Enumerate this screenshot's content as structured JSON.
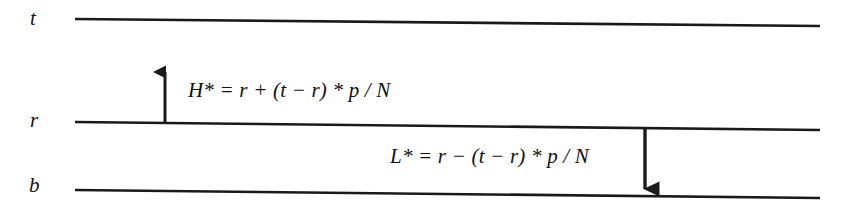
{
  "figure": {
    "type": "annotated-line-diagram",
    "background_color": "#ffffff",
    "line_color": "#1a1a1a",
    "text_color": "#111111",
    "levels": [
      {
        "id": "top",
        "label": "t",
        "label_x": 30,
        "label_y": 8,
        "line_x1": 75,
        "line_y1": 19,
        "line_x2": 820,
        "line_y2": 26
      },
      {
        "id": "middle",
        "label": "r",
        "label_x": 30,
        "label_y": 110,
        "line_x1": 75,
        "line_y1": 122,
        "line_x2": 820,
        "line_y2": 130
      },
      {
        "id": "bottom",
        "label": "b",
        "label_x": 29,
        "label_y": 175,
        "line_x1": 75,
        "line_y1": 190,
        "line_x2": 820,
        "line_y2": 198
      }
    ],
    "arrows": [
      {
        "id": "up-arrow",
        "direction": "up",
        "x": 165,
        "tail_y": 123,
        "head_y": 72,
        "from_level": "middle",
        "toward_level": "top"
      },
      {
        "id": "down-arrow",
        "direction": "down",
        "x": 645,
        "tail_y": 129,
        "head_y": 189,
        "from_level": "middle",
        "toward_level": "bottom"
      }
    ],
    "formulas": [
      {
        "id": "high-threshold",
        "x": 188,
        "y": 80,
        "text": "H* = r + (t − r) * p / N",
        "lhs": "H*",
        "rhs": "r + (t − r) * p / N",
        "associated_arrow": "up-arrow"
      },
      {
        "id": "low-threshold",
        "x": 390,
        "y": 146,
        "text": "L* = r − (t − r) * p / N",
        "lhs": "L*",
        "rhs": "r − (t − r) * p / N",
        "associated_arrow": "down-arrow"
      }
    ]
  }
}
